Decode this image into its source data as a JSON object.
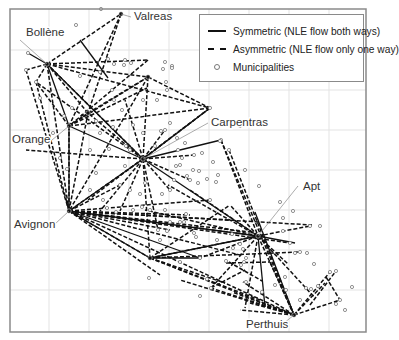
{
  "figure": {
    "frame": {
      "x": 10,
      "y": 9,
      "w": 356,
      "h": 323,
      "stroke": "#8a8a8a"
    },
    "grid": {
      "color": "#e3e3e3",
      "xs": [
        49,
        89,
        129,
        169,
        209,
        249,
        289,
        329
      ],
      "ys": [
        50,
        90,
        130,
        170,
        210,
        250,
        290
      ]
    },
    "colors": {
      "edge": "#111111",
      "municipality": "#777777",
      "leader": "#888888",
      "label": "#333333"
    }
  },
  "legend": {
    "items": [
      {
        "label": "Symmetric (NLE flow both ways)",
        "style": "solid"
      },
      {
        "label": "Asymmetric (NLE flow only one way)",
        "style": "dashed"
      },
      {
        "label": "Municipalities",
        "style": "circle"
      }
    ]
  },
  "hubs": [
    {
      "id": "bollene",
      "label": "Bollène",
      "x": 47,
      "y": 64,
      "lx": 20,
      "ly": 40,
      "tx": 26,
      "ty": 36
    },
    {
      "id": "valreas",
      "label": "Valreas",
      "x": 121,
      "y": 14,
      "lx": 131,
      "ly": 17,
      "tx": 134,
      "ty": 20
    },
    {
      "id": "orange",
      "label": "Orange",
      "x": 69,
      "y": 126,
      "lx": 52,
      "ly": 140,
      "tx": 12,
      "ty": 143
    },
    {
      "id": "carpentras",
      "label": "Carpentras",
      "x": 143,
      "y": 159,
      "lx": 208,
      "ly": 123,
      "tx": 211,
      "ty": 126
    },
    {
      "id": "avignon",
      "label": "Avignon",
      "x": 69,
      "y": 211,
      "lx": 55,
      "ly": 224,
      "tx": 14,
      "ty": 228
    },
    {
      "id": "apt",
      "label": "Apt",
      "x": 258,
      "y": 236,
      "lx": 298,
      "ly": 186,
      "tx": 303,
      "ty": 190
    },
    {
      "id": "perthuis",
      "label": "Perthuis",
      "x": 294,
      "y": 315,
      "lx": 284,
      "ly": 323,
      "tx": 246,
      "ty": 328
    },
    {
      "id": "cavaillon",
      "label": "",
      "x": 150,
      "y": 258
    },
    {
      "id": "pernes",
      "label": "",
      "x": 88,
      "y": 113
    },
    {
      "id": "vaison",
      "label": "",
      "x": 148,
      "y": 77
    }
  ],
  "chart_data": {
    "type": "network",
    "title": "",
    "legend": [
      "Symmetric (NLE flow both ways)",
      "Asymmetric (NLE flow only one way)",
      "Municipalities"
    ],
    "labeled_nodes": [
      "Valreas",
      "Bollène",
      "Orange",
      "Carpentras",
      "Avignon",
      "Apt",
      "Perthuis"
    ],
    "edges_solid": [
      [
        47,
        64,
        69,
        126
      ],
      [
        47,
        64,
        28,
        53
      ],
      [
        69,
        126,
        143,
        159
      ],
      [
        69,
        211,
        143,
        159
      ],
      [
        143,
        159,
        258,
        236
      ],
      [
        143,
        159,
        221,
        140
      ],
      [
        69,
        211,
        258,
        236
      ],
      [
        69,
        211,
        150,
        258
      ],
      [
        150,
        258,
        258,
        236
      ],
      [
        258,
        236,
        295,
        243
      ],
      [
        255,
        212,
        294,
        315
      ],
      [
        69,
        126,
        69,
        211
      ],
      [
        47,
        64,
        143,
        159
      ],
      [
        150,
        258,
        200,
        258
      ],
      [
        80,
        40,
        108,
        78
      ],
      [
        69,
        211,
        200,
        258
      ],
      [
        258,
        236,
        265,
        307
      ]
    ],
    "edges_dashed": [
      [
        47,
        64,
        121,
        14
      ],
      [
        47,
        64,
        148,
        77
      ],
      [
        47,
        64,
        26,
        70
      ],
      [
        47,
        64,
        36,
        82
      ],
      [
        47,
        64,
        69,
        211
      ],
      [
        47,
        64,
        88,
        113
      ],
      [
        47,
        64,
        148,
        60
      ],
      [
        47,
        64,
        210,
        108
      ],
      [
        121,
        14,
        69,
        126
      ],
      [
        121,
        14,
        88,
        113
      ],
      [
        148,
        60,
        69,
        126
      ],
      [
        69,
        126,
        148,
        77
      ],
      [
        69,
        126,
        36,
        82
      ],
      [
        69,
        126,
        210,
        108
      ],
      [
        69,
        126,
        147,
        88
      ],
      [
        69,
        126,
        69,
        211
      ],
      [
        69,
        126,
        88,
        113
      ],
      [
        143,
        159,
        148,
        77
      ],
      [
        143,
        159,
        88,
        113
      ],
      [
        143,
        159,
        36,
        82
      ],
      [
        143,
        159,
        47,
        64
      ],
      [
        143,
        159,
        26,
        150
      ],
      [
        143,
        159,
        69,
        211
      ],
      [
        143,
        159,
        100,
        211
      ],
      [
        143,
        159,
        120,
        211
      ],
      [
        143,
        159,
        158,
        230
      ],
      [
        143,
        159,
        190,
        180
      ],
      [
        143,
        159,
        210,
        108
      ],
      [
        143,
        159,
        194,
        155
      ],
      [
        143,
        159,
        170,
        190
      ],
      [
        143,
        159,
        150,
        258
      ],
      [
        143,
        159,
        125,
        100
      ],
      [
        143,
        159,
        165,
        130
      ],
      [
        36,
        82,
        69,
        211
      ],
      [
        26,
        70,
        69,
        211
      ],
      [
        88,
        113,
        69,
        211
      ],
      [
        148,
        77,
        69,
        211
      ],
      [
        148,
        77,
        88,
        113
      ],
      [
        148,
        77,
        210,
        108
      ],
      [
        210,
        108,
        143,
        159
      ],
      [
        210,
        108,
        88,
        200
      ],
      [
        69,
        211,
        258,
        236
      ],
      [
        69,
        211,
        210,
        200
      ],
      [
        69,
        211,
        230,
        220
      ],
      [
        69,
        211,
        294,
        315
      ],
      [
        69,
        211,
        190,
        215
      ],
      [
        69,
        211,
        240,
        255
      ],
      [
        69,
        211,
        250,
        232
      ],
      [
        69,
        211,
        160,
        275
      ],
      [
        69,
        211,
        120,
        185
      ],
      [
        69,
        211,
        170,
        230
      ],
      [
        69,
        211,
        312,
        225
      ],
      [
        69,
        211,
        150,
        258
      ],
      [
        69,
        211,
        290,
        243
      ],
      [
        150,
        258,
        258,
        236
      ],
      [
        150,
        258,
        294,
        315
      ],
      [
        150,
        258,
        225,
        283
      ],
      [
        150,
        258,
        230,
        205
      ],
      [
        150,
        258,
        300,
        252
      ],
      [
        150,
        258,
        260,
        300
      ],
      [
        258,
        236,
        168,
        185
      ],
      [
        258,
        236,
        200,
        258
      ],
      [
        258,
        236,
        190,
        190
      ],
      [
        258,
        236,
        145,
        210
      ],
      [
        258,
        236,
        310,
        226
      ],
      [
        258,
        236,
        294,
        315
      ],
      [
        258,
        236,
        211,
        288
      ],
      [
        258,
        236,
        230,
        205
      ],
      [
        258,
        236,
        315,
        298
      ],
      [
        258,
        236,
        245,
        308
      ],
      [
        294,
        315,
        211,
        288
      ],
      [
        294,
        315,
        243,
        282
      ],
      [
        294,
        315,
        250,
        303
      ],
      [
        294,
        315,
        180,
        280
      ],
      [
        294,
        315,
        270,
        262
      ],
      [
        294,
        315,
        330,
        272
      ],
      [
        294,
        315,
        340,
        300
      ],
      [
        294,
        315,
        325,
        283
      ],
      [
        294,
        315,
        240,
        310
      ],
      [
        294,
        315,
        232,
        292
      ],
      [
        221,
        140,
        258,
        236
      ],
      [
        221,
        140,
        294,
        315
      ],
      [
        229,
        150,
        294,
        315
      ],
      [
        326,
        277,
        340,
        300
      ],
      [
        310,
        305,
        336,
        271
      ],
      [
        258,
        236,
        288,
        264
      ],
      [
        211,
        288,
        245,
        270
      ],
      [
        226,
        263,
        270,
        262
      ],
      [
        229,
        262,
        262,
        281
      ]
    ],
    "municipalities": [
      [
        101,
        9
      ],
      [
        76,
        25
      ],
      [
        28,
        53
      ],
      [
        26,
        70
      ],
      [
        36,
        82
      ],
      [
        40,
        98
      ],
      [
        108,
        59
      ],
      [
        114,
        64
      ],
      [
        125,
        60
      ],
      [
        131,
        63
      ],
      [
        112,
        90
      ],
      [
        80,
        76
      ],
      [
        100,
        72
      ],
      [
        88,
        113
      ],
      [
        124,
        65
      ],
      [
        114,
        100
      ],
      [
        143,
        100
      ],
      [
        157,
        100
      ],
      [
        167,
        90
      ],
      [
        166,
        82
      ],
      [
        172,
        66
      ],
      [
        172,
        68
      ],
      [
        165,
        62
      ],
      [
        163,
        69
      ],
      [
        148,
        77
      ],
      [
        210,
        108
      ],
      [
        221,
        140
      ],
      [
        229,
        150
      ],
      [
        240,
        126
      ],
      [
        245,
        170
      ],
      [
        207,
        179
      ],
      [
        259,
        186
      ],
      [
        280,
        202
      ],
      [
        283,
        218
      ],
      [
        283,
        231
      ],
      [
        293,
        211
      ],
      [
        310,
        226
      ],
      [
        290,
        243
      ],
      [
        295,
        253
      ],
      [
        300,
        252
      ],
      [
        307,
        253
      ],
      [
        320,
        226
      ],
      [
        330,
        272
      ],
      [
        336,
        271
      ],
      [
        340,
        300
      ],
      [
        352,
        287
      ],
      [
        345,
        310
      ],
      [
        336,
        304
      ],
      [
        300,
        300
      ],
      [
        286,
        290
      ],
      [
        285,
        277
      ],
      [
        275,
        285
      ],
      [
        246,
        282
      ],
      [
        246,
        258
      ],
      [
        241,
        265
      ],
      [
        244,
        262
      ],
      [
        211,
        288
      ],
      [
        200,
        258
      ],
      [
        217,
        240
      ],
      [
        233,
        248
      ],
      [
        262,
        292
      ],
      [
        311,
        289
      ],
      [
        318,
        286
      ],
      [
        314,
        264
      ],
      [
        306,
        288
      ],
      [
        243,
        249
      ],
      [
        232,
        234
      ],
      [
        240,
        244
      ],
      [
        196,
        237
      ],
      [
        207,
        279
      ],
      [
        226,
        261
      ],
      [
        149,
        278
      ],
      [
        200,
        296
      ],
      [
        180,
        262
      ],
      [
        170,
        222
      ],
      [
        180,
        222
      ],
      [
        167,
        231
      ],
      [
        184,
        222
      ],
      [
        194,
        233
      ],
      [
        160,
        240
      ],
      [
        158,
        230
      ],
      [
        186,
        214
      ],
      [
        210,
        200
      ],
      [
        190,
        180
      ],
      [
        194,
        155
      ],
      [
        170,
        190
      ],
      [
        174,
        180
      ],
      [
        165,
        130
      ],
      [
        126,
        146
      ],
      [
        130,
        150
      ],
      [
        180,
        165
      ],
      [
        187,
        176
      ],
      [
        202,
        153
      ],
      [
        213,
        162
      ],
      [
        199,
        171
      ],
      [
        193,
        170
      ],
      [
        220,
        141
      ],
      [
        218,
        175
      ],
      [
        216,
        182
      ],
      [
        176,
        166
      ],
      [
        155,
        146
      ],
      [
        178,
        150
      ],
      [
        185,
        143
      ],
      [
        177,
        138
      ],
      [
        170,
        123
      ],
      [
        161,
        131
      ],
      [
        182,
        158
      ],
      [
        198,
        183
      ],
      [
        143,
        133
      ],
      [
        120,
        185
      ],
      [
        125,
        166
      ],
      [
        90,
        190
      ],
      [
        96,
        173
      ],
      [
        103,
        200
      ],
      [
        107,
        208
      ],
      [
        116,
        212
      ],
      [
        133,
        210
      ],
      [
        142,
        207
      ],
      [
        150,
        210
      ],
      [
        165,
        210
      ],
      [
        162,
        194
      ],
      [
        140,
        194
      ],
      [
        130,
        190
      ],
      [
        145,
        183
      ],
      [
        100,
        133
      ],
      [
        113,
        127
      ],
      [
        96,
        121
      ],
      [
        90,
        150
      ],
      [
        67,
        169
      ],
      [
        60,
        158
      ],
      [
        53,
        133
      ],
      [
        64,
        116
      ],
      [
        72,
        108
      ],
      [
        109,
        149
      ],
      [
        122,
        110
      ],
      [
        133,
        125
      ]
    ]
  }
}
